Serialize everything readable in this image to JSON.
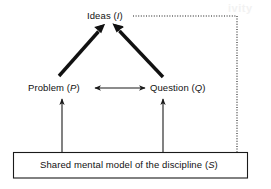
{
  "diagram": {
    "colors": {
      "stroke": "#1a1a1a",
      "text": "#111111",
      "background": "#ffffff",
      "watermark": "#f2f2f2"
    },
    "nodes": [
      {
        "id": "ideas",
        "text": "Ideas",
        "symbol": "I",
        "full_label": "Ideas (I)"
      },
      {
        "id": "problem",
        "text": "Problem",
        "symbol": "P",
        "full_label": "Problem (P)"
      },
      {
        "id": "question",
        "text": "Question",
        "symbol": "Q",
        "full_label": "Question (Q)"
      },
      {
        "id": "shared-model",
        "text": "Shared mental model of the discipline",
        "symbol": "S",
        "full_label": "Shared mental model of the discipline (S)"
      }
    ],
    "edges": [
      {
        "id": "problem-to-ideas",
        "from": "Problem (P)",
        "to": "Ideas (I)",
        "style": "thick-solid",
        "arrowheads": "end"
      },
      {
        "id": "question-to-ideas",
        "from": "Question (Q)",
        "to": "Ideas (I)",
        "style": "thick-solid",
        "arrowheads": "end"
      },
      {
        "id": "problem-question",
        "from": "Problem (P)",
        "to": "Question (Q)",
        "style": "thin-solid",
        "arrowheads": "both"
      },
      {
        "id": "shared-to-problem",
        "from": "Shared mental model of the discipline (S)",
        "to": "Problem (P)",
        "style": "thin-solid",
        "arrowheads": "end"
      },
      {
        "id": "shared-to-question",
        "from": "Shared mental model of the discipline (S)",
        "to": "Question (Q)",
        "style": "thin-solid",
        "arrowheads": "end"
      },
      {
        "id": "ideas-to-shared",
        "from": "Ideas (I)",
        "to": "Shared mental model of the discipline (S)",
        "style": "dotted",
        "arrowheads": "end"
      }
    ],
    "watermark": {
      "text": "ivity"
    },
    "open_paren": "(",
    "close_paren": ")"
  }
}
